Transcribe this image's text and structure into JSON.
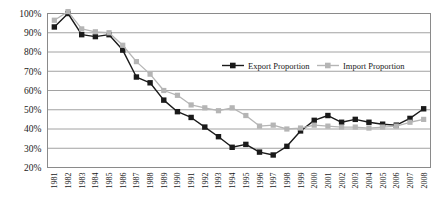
{
  "chart_data": {
    "type": "line",
    "title": "",
    "xlabel": "",
    "ylabel": "",
    "ylim": [
      20,
      100
    ],
    "ytick_labels": [
      "100%",
      "90%",
      "80%",
      "70%",
      "60%",
      "50%",
      "40%",
      "30%",
      "20%"
    ],
    "ytick_values": [
      100,
      90,
      80,
      70,
      60,
      50,
      40,
      30,
      20
    ],
    "grid": true,
    "legend_position": "inside-upper-right",
    "categories": [
      "1981",
      "1982",
      "1983",
      "1984",
      "1985",
      "1986",
      "1987",
      "1988",
      "1989",
      "1990",
      "1991",
      "1992",
      "1993",
      "1994",
      "1995",
      "1996",
      "1997",
      "1998",
      "1999",
      "2000",
      "2001",
      "2002",
      "2003",
      "2004",
      "2005",
      "2006",
      "2007",
      "2008"
    ],
    "series": [
      {
        "name": "Export Proportion",
        "color": "#1a1a1a",
        "marker": "square",
        "values": [
          93,
          100,
          89,
          88,
          89,
          81,
          67,
          64,
          55,
          49,
          46,
          41,
          36,
          30.5,
          32,
          28,
          26.5,
          31,
          39,
          44.5,
          47,
          43.5,
          45,
          43.5,
          42.5,
          42,
          45.5,
          50.5
        ]
      },
      {
        "name": "Import Proportion",
        "color": "#b5b5b5",
        "marker": "square",
        "values": [
          96.5,
          101,
          92,
          90.5,
          90,
          83.5,
          75,
          68.5,
          60,
          57.5,
          52.5,
          51,
          49.5,
          51,
          47,
          41.5,
          42,
          40,
          40.5,
          42,
          41.5,
          41,
          41,
          40.5,
          41,
          41.5,
          43.5,
          45
        ]
      }
    ]
  },
  "legend": {
    "items": [
      {
        "label": "Export Proportion",
        "color": "#1a1a1a",
        "style": "solid"
      },
      {
        "label": "Import Proportion",
        "color": "#b5b5b5",
        "style": "solid"
      }
    ]
  }
}
